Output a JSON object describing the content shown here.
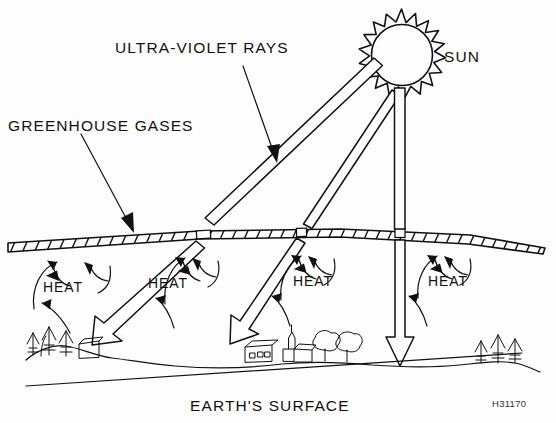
{
  "figure": {
    "title_code": "H31170",
    "background_color": "#fdfdfd",
    "ink_color": "#111111",
    "width": 556,
    "height": 423
  },
  "labels": {
    "ultraviolet_rays": "ULTRA-VIOLET RAYS",
    "greenhouse_gases": "GREENHOUSE GASES",
    "sun": "SUN",
    "earths_surface": "EARTH'S SURFACE",
    "heat_1": "HEAT",
    "heat_2": "HEAT",
    "heat_3": "HEAT",
    "heat_4": "HEAT"
  },
  "diagram": {
    "type": "schematic-illustration",
    "elements": [
      {
        "name": "sun",
        "kind": "spiked-circle",
        "spikes": 18,
        "position": "top-right"
      },
      {
        "name": "uv-ray-left",
        "kind": "hollow-beam",
        "direction": "down-left",
        "passes_atmosphere": true
      },
      {
        "name": "uv-ray-middle",
        "kind": "hollow-beam",
        "direction": "down-left",
        "passes_atmosphere": true
      },
      {
        "name": "uv-ray-vertical",
        "kind": "hollow-beam",
        "direction": "down",
        "passes_atmosphere": true
      },
      {
        "name": "greenhouse-gas-band",
        "kind": "hatched-band",
        "orientation": "slightly-tilted"
      },
      {
        "name": "heat-arrows",
        "kind": "curved-arrows",
        "count": 4,
        "behaviour": "rising and reflected"
      },
      {
        "name": "ground-line",
        "kind": "horizon"
      },
      {
        "name": "conifer-cluster-left",
        "kind": "trees"
      },
      {
        "name": "village",
        "kind": "buildings-and-trees"
      },
      {
        "name": "conifer-cluster-right",
        "kind": "trees"
      }
    ]
  }
}
